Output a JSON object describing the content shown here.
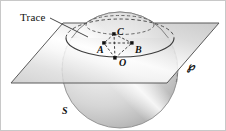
{
  "figure": {
    "background_color": "#ffffff",
    "border_color": "#c8c8c8",
    "width": 226,
    "height": 131
  },
  "labels": {
    "trace": "Trace",
    "point_c": "C",
    "point_a": "A",
    "point_b": "B",
    "point_o": "O",
    "sphere": "S",
    "plane": "℘"
  },
  "colors": {
    "outline": "#4a4a4a",
    "dashed": "#555555",
    "sphere_light": "#f2f2f2",
    "sphere_mid": "#d2d2d2",
    "sphere_dark": "#a8a8a8",
    "plane_light": "#fbfbfb",
    "plane_mid": "#d8d8d8",
    "plane_dark": "#b4b4b4",
    "dot": "#111111",
    "text": "#111111"
  },
  "geometry": {
    "sphere": {
      "cx": 119,
      "cy": 69,
      "r": 58
    },
    "plane_corners": [
      [
        10,
        82
      ],
      [
        62,
        22
      ],
      [
        218,
        22
      ],
      [
        166,
        82
      ]
    ],
    "trace_ellipse": {
      "cx": 119,
      "cy": 37,
      "rx": 54,
      "ry": 19
    },
    "cap_ellipse": {
      "cx": 119,
      "cy": 24,
      "rx": 34,
      "ry": 10
    },
    "points": {
      "C": [
        113,
        33
      ],
      "A": [
        103,
        42
      ],
      "B": [
        131,
        42
      ],
      "O": [
        114,
        57
      ]
    },
    "leader_line": [
      [
        49,
        18
      ],
      [
        86,
        35
      ]
    ]
  }
}
